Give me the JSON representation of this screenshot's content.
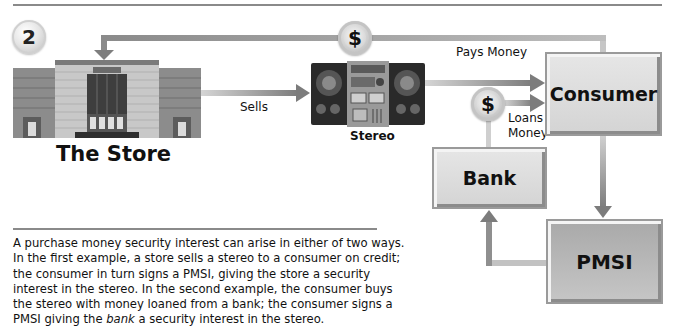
{
  "figure": {
    "step_number": "2",
    "colors": {
      "arrow": "#8a8a8a",
      "box_light": "#dcdcdc",
      "box_dark": "#b4b4b4",
      "rule": "#8a8a8a"
    }
  },
  "nodes": {
    "store": {
      "label": "The Store",
      "sign": "THE STORE",
      "icon": "store-building-icon"
    },
    "stereo": {
      "label": "Stereo",
      "icon": "stereo-boombox-icon"
    },
    "consumer": {
      "label": "Consumer"
    },
    "bank": {
      "label": "Bank"
    },
    "pmsi": {
      "label": "PMSI"
    }
  },
  "edges": {
    "store_to_stereo": {
      "label": "Sells"
    },
    "consumer_to_store": {
      "label": "Pays Money",
      "icon": "dollar-coin-icon",
      "symbol": "$"
    },
    "bank_to_consumer": {
      "label_line1": "Loans",
      "label_line2": "Money",
      "icon": "dollar-coin-icon",
      "symbol": "$"
    },
    "stereo_to_consumer": {
      "label": ""
    },
    "consumer_to_pmsi": {
      "label": ""
    },
    "pmsi_to_bank": {
      "label": ""
    }
  },
  "caption": {
    "part1": "A purchase money security interest can arise in either of two ways. In the first example, a store sells a stereo to a consumer on credit; the consumer in turn signs a PMSI, giving the store a security interest in the stereo. In the second example, the consumer buys the stereo with money loaned from a bank; the consumer signs a PMSI giving the ",
    "emphasis": "bank",
    "part2": " a security interest in the stereo."
  }
}
